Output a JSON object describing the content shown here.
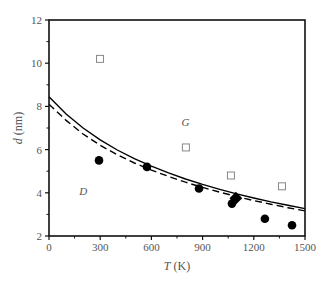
{
  "chart_data": {
    "type": "scatter",
    "title": "",
    "xlabel": "T (K)",
    "xlabel_italic": "T",
    "xlabel_unit": "(K)",
    "ylabel": "d (nm)",
    "ylabel_italic": "d",
    "ylabel_unit": "(nm)",
    "xlim": [
      0,
      1500
    ],
    "ylim": [
      2,
      12
    ],
    "xticks": [
      0,
      300,
      600,
      900,
      1200,
      1500
    ],
    "yticks": [
      2,
      4,
      6,
      8,
      10,
      12
    ],
    "grid": false,
    "legend": "none",
    "annotations": [
      {
        "text": "G",
        "x": 800,
        "y": 7.1
      },
      {
        "text": "D",
        "x": 200,
        "y": 3.9
      }
    ],
    "series": [
      {
        "name": "filled circles",
        "marker": "circle-filled",
        "x": [
          293,
          574,
          879,
          1072,
          1265,
          1424
        ],
        "y": [
          5.5,
          5.2,
          4.2,
          3.5,
          2.8,
          2.5
        ]
      },
      {
        "name": "filled diamond",
        "marker": "diamond-filled",
        "x": [
          1095
        ],
        "y": [
          3.75
        ]
      },
      {
        "name": "open squares",
        "marker": "square-open",
        "x": [
          299,
          802,
          1066,
          1365
        ],
        "y": [
          10.2,
          6.1,
          4.8,
          4.3
        ]
      },
      {
        "name": "solid curve",
        "style": "solid",
        "x": [
          0,
          100,
          200,
          300,
          400,
          500,
          600,
          700,
          800,
          900,
          1000,
          1100,
          1200,
          1300,
          1400,
          1500
        ],
        "y": [
          8.45,
          7.65,
          7.0,
          6.45,
          5.98,
          5.58,
          5.23,
          4.92,
          4.64,
          4.39,
          4.16,
          3.95,
          3.76,
          3.58,
          3.42,
          3.27
        ]
      },
      {
        "name": "dashed curve",
        "style": "dashed",
        "x": [
          0,
          100,
          200,
          300,
          400,
          500,
          600,
          700,
          800,
          900,
          1000,
          1100,
          1200,
          1300,
          1400,
          1500
        ],
        "y": [
          8.1,
          7.35,
          6.72,
          6.2,
          5.76,
          5.38,
          5.05,
          4.76,
          4.49,
          4.25,
          4.03,
          3.83,
          3.64,
          3.47,
          3.31,
          3.16
        ]
      }
    ]
  },
  "layout": {
    "plot": {
      "left": 49,
      "right": 305,
      "top": 20,
      "bottom": 236
    },
    "colors": {
      "axis": "#111111",
      "filled": "#000000",
      "open": "#888888",
      "text": "#555555"
    }
  }
}
